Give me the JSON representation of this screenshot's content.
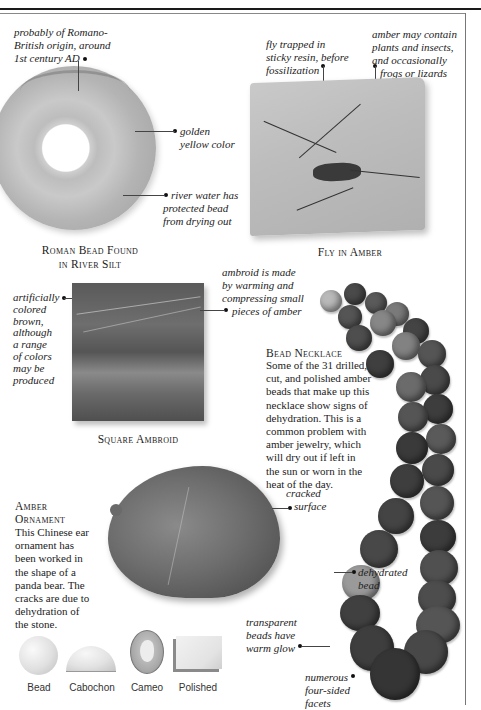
{
  "header": {
    "section_title": "Shell of"
  },
  "roman_bead": {
    "title_line1": "Roman Bead Found",
    "title_line2": "in River Silt",
    "annotations": {
      "origin": [
        "probably of Romano-",
        "British origin, around",
        "1st century AD"
      ],
      "color": [
        "golden",
        "yellow color"
      ],
      "river": [
        "river water has",
        "protected bead",
        "from drying out"
      ]
    }
  },
  "fly_in_amber": {
    "title": "Fly in Amber",
    "annotations": {
      "fly": [
        "fly trapped in",
        "sticky resin, before",
        "fossilization"
      ],
      "contents": [
        "amber may contain",
        "plants and insects,",
        "and occasionally",
        "frogs or lizards"
      ]
    }
  },
  "square_ambroid": {
    "title": "Square Ambroid",
    "annotations": {
      "colored": [
        "artificially",
        "colored",
        "brown,",
        "although",
        "a range",
        "of colors",
        "may be",
        "produced"
      ],
      "made": [
        "ambroid is made",
        "by warming and",
        "compressing small",
        "pieces of amber"
      ]
    }
  },
  "bead_necklace": {
    "title": "Bead Necklace",
    "body": [
      "Some of the 31 drilled,",
      "cut, and polished amber",
      "beads that make up this",
      "necklace show signs of",
      "dehydration. This is a",
      "common problem with",
      "amber jewelry, which",
      "will dry out if left in",
      "the sun or worn in the",
      "heat of the day."
    ],
    "annotations": {
      "dehydrated": [
        "dehydrated",
        "bead"
      ],
      "transparent": [
        "transparent",
        "beads have",
        "warm glow"
      ],
      "facets": [
        "numerous",
        "four-sided",
        "facets"
      ]
    }
  },
  "amber_ornament": {
    "title_line1": "Amber",
    "title_line2": "Ornament",
    "body": [
      "This Chinese ear",
      "ornament has",
      "been worked in",
      "the shape of a",
      "panda bear. The",
      "cracks are due to",
      "dehydration of",
      "the stone."
    ],
    "annotations": {
      "cracked": [
        "cracked",
        "surface"
      ]
    }
  },
  "cut_types": [
    {
      "label": "Bead"
    },
    {
      "label": "Cabochon"
    },
    {
      "label": "Cameo"
    },
    {
      "label": "Polished"
    }
  ]
}
